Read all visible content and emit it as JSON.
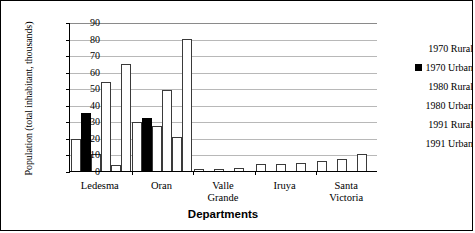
{
  "chart_data": {
    "type": "bar",
    "title": "",
    "xlabel": "Departments",
    "ylabel": "Population (total inhabitant, thousands)",
    "categories": [
      "Ledesma",
      "Oran",
      "Valle Grande",
      "Iruya",
      "Santa Victoria"
    ],
    "category_lines": [
      [
        "Ledesma"
      ],
      [
        "Oran"
      ],
      [
        "Valle",
        "Grande"
      ],
      [
        "Iruya"
      ],
      [
        "Santa",
        "Victoria"
      ]
    ],
    "ylim": [
      0,
      90
    ],
    "yticks": [
      0,
      10,
      20,
      30,
      40,
      50,
      60,
      70,
      80,
      90
    ],
    "ytick_labels": [
      "0",
      "10",
      "20",
      "30",
      "40",
      "50",
      "60",
      "70",
      "80",
      "90"
    ],
    "grid": true,
    "legend_position": "right",
    "series": [
      {
        "name": "1970 Rural",
        "fill": "white",
        "values": [
          19.5,
          29.5,
          1.2,
          4.0,
          6.3
        ]
      },
      {
        "name": "1970 Urban",
        "fill": "black",
        "values": [
          35.0,
          32.0,
          0,
          0,
          0
        ]
      },
      {
        "name": "1980 Rural",
        "fill": "white",
        "values": [
          10.5,
          27.0,
          1.2,
          4.0,
          7.0
        ]
      },
      {
        "name": "1980 Urban",
        "fill": "white",
        "values": [
          53.5,
          49.0,
          0,
          0,
          0
        ]
      },
      {
        "name": "1991 Rural",
        "fill": "white",
        "values": [
          3.5,
          20.5,
          1.8,
          5.0,
          10.3
        ]
      },
      {
        "name": "1991 Urban",
        "fill": "white",
        "values": [
          64.5,
          80.0,
          0,
          0,
          0
        ]
      }
    ]
  },
  "legend": {
    "items": [
      {
        "label": "1970 Rural",
        "fill": "white"
      },
      {
        "label": "1970 Urban",
        "fill": "black"
      },
      {
        "label": "1980 Rural",
        "fill": "white"
      },
      {
        "label": "1980 Urban",
        "fill": "white"
      },
      {
        "label": "1991 Rural",
        "fill": "white"
      },
      {
        "label": "1991 Urban",
        "fill": "white"
      }
    ]
  }
}
